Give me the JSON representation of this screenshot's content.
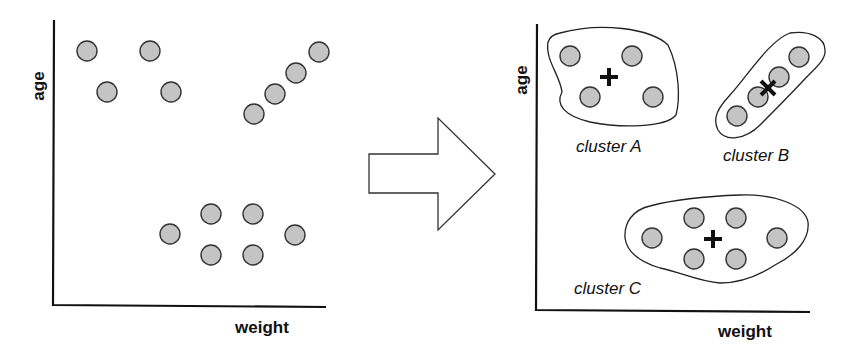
{
  "left_plot": {
    "x_label": "weight",
    "y_label": "age",
    "points": [
      {
        "x": 87,
        "y": 51
      },
      {
        "x": 150,
        "y": 51
      },
      {
        "x": 107,
        "y": 92
      },
      {
        "x": 171,
        "y": 92
      },
      {
        "x": 254,
        "y": 114
      },
      {
        "x": 275,
        "y": 94
      },
      {
        "x": 296,
        "y": 73
      },
      {
        "x": 319,
        "y": 52
      },
      {
        "x": 170,
        "y": 234
      },
      {
        "x": 211,
        "y": 214
      },
      {
        "x": 253,
        "y": 214
      },
      {
        "x": 295,
        "y": 235
      },
      {
        "x": 211,
        "y": 255
      },
      {
        "x": 253,
        "y": 255
      }
    ]
  },
  "arrow": {
    "direction": "right"
  },
  "right_plot": {
    "x_label": "weight",
    "y_label": "age",
    "clusters": [
      {
        "label": "cluster A",
        "centroid": {
          "x": 609,
          "y": 77
        },
        "points": [
          {
            "x": 570,
            "y": 56
          },
          {
            "x": 632,
            "y": 56
          },
          {
            "x": 590,
            "y": 97
          },
          {
            "x": 653,
            "y": 97
          }
        ]
      },
      {
        "label": "cluster B",
        "centroid": {
          "x": 768,
          "y": 88
        },
        "points": [
          {
            "x": 737,
            "y": 116
          },
          {
            "x": 758,
            "y": 97
          },
          {
            "x": 779,
            "y": 77
          },
          {
            "x": 799,
            "y": 57
          }
        ]
      },
      {
        "label": "cluster C",
        "centroid": {
          "x": 713,
          "y": 239
        },
        "points": [
          {
            "x": 652,
            "y": 238
          },
          {
            "x": 694,
            "y": 218
          },
          {
            "x": 736,
            "y": 218
          },
          {
            "x": 777,
            "y": 238
          },
          {
            "x": 694,
            "y": 259
          },
          {
            "x": 736,
            "y": 259
          }
        ]
      }
    ]
  },
  "colors": {
    "dot_fill": "#c4c4c4",
    "stroke": "#222222"
  }
}
